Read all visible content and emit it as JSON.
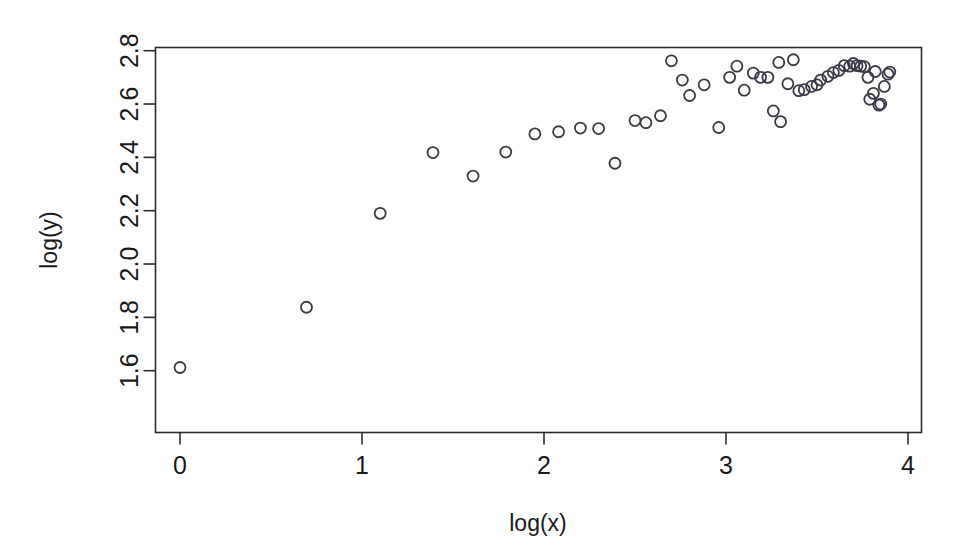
{
  "chart_data": {
    "type": "scatter",
    "title": "",
    "xlabel": "log(x)",
    "ylabel": "log(y)",
    "xlim": [
      -0.12,
      4.02
    ],
    "ylim": [
      1.565,
      2.82
    ],
    "xticks": [
      0,
      1,
      2,
      3,
      4
    ],
    "xtick_labels": [
      "0",
      "1",
      "2",
      "3",
      "4"
    ],
    "yticks": [
      1.6,
      1.8,
      2.0,
      2.2,
      2.4,
      2.6,
      2.8
    ],
    "ytick_labels": [
      "1.6",
      "1.8",
      "2.0",
      "2.2",
      "2.4",
      "2.6",
      "2.8"
    ],
    "grid": false,
    "legend": null,
    "marker": "open-circle",
    "marker_size_px": 11,
    "marker_color": "#3a3a48",
    "box_border": true,
    "points": [
      [
        0.0,
        1.612
      ],
      [
        0.695,
        1.838
      ],
      [
        1.1,
        2.19
      ],
      [
        1.39,
        2.418
      ],
      [
        1.61,
        2.33
      ],
      [
        1.79,
        2.42
      ],
      [
        1.95,
        2.488
      ],
      [
        2.08,
        2.496
      ],
      [
        2.2,
        2.51
      ],
      [
        2.3,
        2.508
      ],
      [
        2.39,
        2.378
      ],
      [
        2.5,
        2.538
      ],
      [
        2.56,
        2.53
      ],
      [
        2.64,
        2.556
      ],
      [
        2.7,
        2.762
      ],
      [
        2.76,
        2.69
      ],
      [
        2.8,
        2.632
      ],
      [
        2.88,
        2.672
      ],
      [
        2.96,
        2.512
      ],
      [
        3.02,
        2.7
      ],
      [
        3.06,
        2.742
      ],
      [
        3.1,
        2.652
      ],
      [
        3.15,
        2.716
      ],
      [
        3.19,
        2.7
      ],
      [
        3.23,
        2.7
      ],
      [
        3.26,
        2.574
      ],
      [
        3.29,
        2.756
      ],
      [
        3.3,
        2.534
      ],
      [
        3.34,
        2.676
      ],
      [
        3.37,
        2.766
      ],
      [
        3.4,
        2.65
      ],
      [
        3.43,
        2.654
      ],
      [
        3.47,
        2.666
      ],
      [
        3.5,
        2.672
      ],
      [
        3.52,
        2.69
      ],
      [
        3.56,
        2.704
      ],
      [
        3.59,
        2.718
      ],
      [
        3.62,
        2.726
      ],
      [
        3.65,
        2.744
      ],
      [
        3.68,
        2.742
      ],
      [
        3.7,
        2.752
      ],
      [
        3.72,
        2.744
      ],
      [
        3.74,
        2.742
      ],
      [
        3.76,
        2.74
      ],
      [
        3.78,
        2.7
      ],
      [
        3.79,
        2.618
      ],
      [
        3.81,
        2.64
      ],
      [
        3.82,
        2.722
      ],
      [
        3.84,
        2.596
      ],
      [
        3.85,
        2.6
      ],
      [
        3.87,
        2.666
      ],
      [
        3.89,
        2.712
      ],
      [
        3.9,
        2.72
      ]
    ]
  },
  "axes": {
    "x_axis_name": "log(x)",
    "y_axis_name": "log(y)"
  }
}
